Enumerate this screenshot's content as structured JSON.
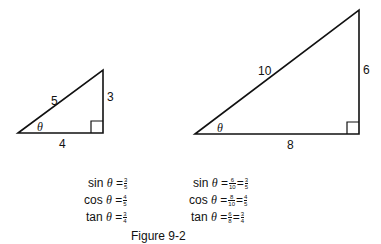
{
  "small_triangle": {
    "hypotenuse": "5",
    "opposite": "3",
    "adjacent": "4",
    "angle": "θ"
  },
  "large_triangle": {
    "hypotenuse": "10",
    "opposite": "6",
    "adjacent": "8",
    "angle": "θ"
  },
  "left_equations": [
    {
      "func": "sin",
      "theta": "θ",
      "eq": "=",
      "fracs": [
        {
          "num": "3",
          "den": "5"
        }
      ]
    },
    {
      "func": "cos",
      "theta": "θ",
      "eq": "=",
      "fracs": [
        {
          "num": "4",
          "den": "5"
        }
      ]
    },
    {
      "func": "tan",
      "theta": "θ",
      "eq": "=",
      "fracs": [
        {
          "num": "3",
          "den": "4"
        }
      ]
    }
  ],
  "right_equations": [
    {
      "func": "sin",
      "theta": "θ",
      "eq": "=",
      "fracs": [
        {
          "num": "6",
          "den": "10"
        },
        {
          "num": "3",
          "den": "5"
        }
      ]
    },
    {
      "func": "cos",
      "theta": "θ",
      "eq": "=",
      "fracs": [
        {
          "num": "8",
          "den": "10"
        },
        {
          "num": "4",
          "den": "5"
        }
      ]
    },
    {
      "func": "tan",
      "theta": "θ",
      "eq": "=",
      "fracs": [
        {
          "num": "6",
          "den": "8"
        },
        {
          "num": "3",
          "den": "4"
        }
      ]
    }
  ],
  "caption": "Figure 9-2"
}
